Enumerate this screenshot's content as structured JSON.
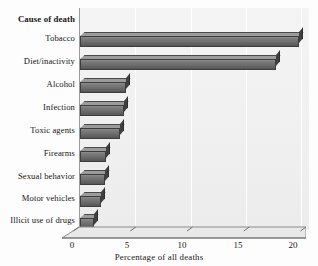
{
  "chart_data": {
    "type": "bar",
    "orientation": "horizontal",
    "title": "",
    "category_axis_title": "Cause of death",
    "xlabel": "Percentage of all deaths",
    "ylabel": "",
    "xlim": [
      0,
      20
    ],
    "xticks": [
      0,
      5,
      10,
      15,
      20
    ],
    "xtick_labels": [
      "0",
      "5",
      "10",
      "15",
      "20"
    ],
    "grid": true,
    "grid_axis": "x",
    "legend": false,
    "style": "3d-shaded-bars",
    "categories": [
      "Tobacco",
      "Diet/inactivity",
      "Alcohol",
      "Infection",
      "Toxic agents",
      "Firearms",
      "Sexual behavior",
      "Motor vehicles",
      "Illicit use of drugs"
    ],
    "values": [
      19,
      17,
      4,
      3.8,
      3.5,
      2.3,
      2.2,
      1.8,
      1.2
    ],
    "series": [
      {
        "name": "Percentage of all deaths",
        "values": [
          19,
          17,
          4,
          3.8,
          3.5,
          2.3,
          2.2,
          1.8,
          1.2
        ]
      }
    ]
  },
  "colors": {
    "bar_face_light": "#8e8e8e",
    "bar_face_dark": "#565656",
    "bar_top": "#9b9b9b",
    "bar_side": "#3f3f3f",
    "plot_background": "#f1f1f1",
    "gridline": "#ffffff",
    "axis_line": "#6f6f6f",
    "text": "#171717",
    "page_background": "#fdfdfd"
  }
}
